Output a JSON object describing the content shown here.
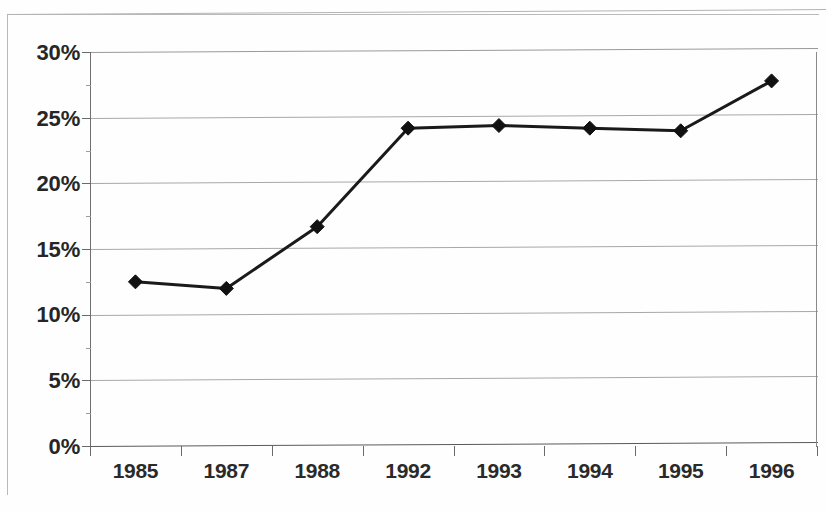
{
  "chart_data": {
    "type": "line",
    "title": "",
    "subtitle": "",
    "xlabel": "",
    "ylabel": "",
    "categories": [
      "1985",
      "1987",
      "1988",
      "1992",
      "1993",
      "1994",
      "1995",
      "1996"
    ],
    "values": [
      12.5,
      12.0,
      16.7,
      24.2,
      24.4,
      24.2,
      24.0,
      27.8
    ],
    "value_suffix": "%",
    "series": [
      {
        "name": "",
        "values": [
          12.5,
          12.0,
          16.7,
          24.2,
          24.4,
          24.2,
          24.0,
          27.8
        ],
        "marker": "diamond",
        "color": "#1a1a1a"
      }
    ],
    "ylim": [
      0,
      30
    ],
    "ytick_step": 5,
    "ytick_labels": [
      "0%",
      "5%",
      "10%",
      "15%",
      "20%",
      "25%",
      "30%"
    ],
    "ytick_values": [
      0,
      5,
      10,
      15,
      20,
      25,
      30
    ],
    "grid": true,
    "grid_axis": "y",
    "legend": false,
    "legend_position": "none",
    "line_color": "#1a1a1a",
    "marker_color": "#111111",
    "grid_color": "#a8a8a8",
    "background_color": "#ffffff"
  },
  "axes": {
    "y": {
      "labels": [
        "30%",
        "25%",
        "20%",
        "15%",
        "10%",
        "5%",
        "0%"
      ]
    },
    "x": {
      "labels": [
        "1985",
        "1987",
        "1988",
        "1992",
        "1993",
        "1994",
        "1995",
        "1996"
      ]
    }
  }
}
